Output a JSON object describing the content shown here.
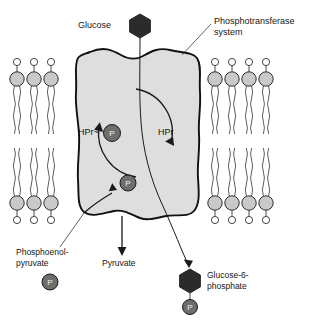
{
  "figure": {
    "background_color": "#ffffff"
  },
  "colors": {
    "cell_fill": "#dedede",
    "cell_stroke": "#111111",
    "lipid_head_fill": "#c9c9c9",
    "lipid_tip_fill": "#ffffff",
    "phosphate_fill": "#6e6e6e",
    "phosphate_text": "#f2f2f2",
    "sugar_fill": "#2b2b2b",
    "line": "#1a1a1a",
    "label_text": "#161616"
  },
  "labels": {
    "glucose": "Glucose",
    "phosphotransferase_system": "Phosphotransferase",
    "phosphotransferase_system_line2": "system",
    "hpr_phospho": "HPr~",
    "hpr": "HPr",
    "phosphoenol": "Phosphoenol-",
    "pyruvate_suffix": "pyruvate",
    "pyruvate": "Pyruvate",
    "glucose6": "Glucose-6-",
    "phosphate_suffix": "phosphate",
    "phosphate_glyph": "P"
  },
  "molecules": {
    "glucose": {
      "name": "Glucose",
      "shape": "hexagon",
      "fill": "#2b2b2b",
      "cx": 140,
      "cy": 26,
      "r": 12
    },
    "glucose_6_phosphate": {
      "name": "Glucose-6-phosphate",
      "shape": "hexagon",
      "fill": "#2b2b2b",
      "cx": 190,
      "cy": 281,
      "r": 12,
      "phosphate": {
        "cx": 190,
        "cy": 307,
        "r": 7.5
      }
    },
    "phosphoenolpyruvate": {
      "name": "Phosphoenolpyruvate",
      "phosphate": {
        "cx": 50,
        "cy": 282,
        "r": 8
      }
    },
    "hpr_phosphate": {
      "cx": 112,
      "cy": 133,
      "r": 8.5
    },
    "transfer_phosphate": {
      "cx": 128,
      "cy": 183,
      "r": 8
    }
  },
  "membrane": {
    "leaflets": [
      {
        "name": "upper-left-leaflet",
        "count": 3,
        "orientation": "heads-up",
        "x_start": 17,
        "spacing": 17,
        "head_y": 79
      },
      {
        "name": "lower-left-leaflet",
        "count": 3,
        "orientation": "heads-down",
        "x_start": 17,
        "spacing": 17,
        "head_y": 203
      },
      {
        "name": "upper-right-leaflet",
        "count": 4,
        "orientation": "heads-up",
        "x_start": 215,
        "spacing": 17,
        "head_y": 79
      },
      {
        "name": "lower-right-leaflet",
        "count": 4,
        "orientation": "heads-down",
        "x_start": 215,
        "spacing": 17,
        "head_y": 203
      }
    ]
  },
  "cycle": {
    "name": "HPr phosphorylation cycle",
    "cx": 136,
    "cy": 133,
    "r": 44,
    "direction": "clockwise"
  },
  "arrows": [
    {
      "name": "glucose-uptake-path",
      "from": "Glucose",
      "to": "Glucose-6-phosphate"
    },
    {
      "name": "pep-to-phosphate-arrow",
      "from": "Phosphoenolpyruvate",
      "to": "phosphate carrier"
    },
    {
      "name": "pyruvate-arrow",
      "from": "Phosphoenolpyruvate",
      "to": "Pyruvate"
    }
  ]
}
